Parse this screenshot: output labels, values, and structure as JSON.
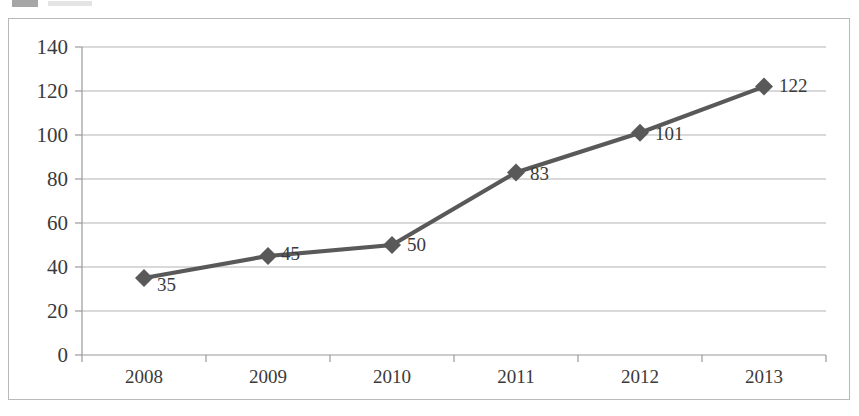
{
  "legend": {
    "swatch_color": "#a6a6a6",
    "swatch_name": "series-swatch"
  },
  "chart_data": {
    "type": "line",
    "title": "",
    "subtitle": "",
    "xlabel": "",
    "ylabel": "",
    "categories": [
      "2008",
      "2009",
      "2010",
      "2011",
      "2012",
      "2013"
    ],
    "values": [
      35,
      45,
      50,
      83,
      101,
      122
    ],
    "point_labels": [
      "35",
      "45",
      "50",
      "83",
      "101",
      "122"
    ],
    "series": [
      {
        "name": "Series 1",
        "values": [
          35,
          45,
          50,
          83,
          101,
          122
        ],
        "line_color": "#595959",
        "marker": "diamond",
        "marker_color": "#595959"
      }
    ],
    "ylim": [
      0,
      140
    ],
    "yticks": [
      0,
      20,
      40,
      60,
      80,
      100,
      120,
      140
    ],
    "ytick_labels": [
      "0",
      "20",
      "40",
      "60",
      "80",
      "100",
      "120",
      "140"
    ],
    "grid": "horizontal",
    "legend_position": "top-left",
    "plot_background": "#ffffff",
    "grid_color": "#b3b3b3",
    "axis_color": "#9a9a9a",
    "border_color": "#b9b9b9"
  }
}
